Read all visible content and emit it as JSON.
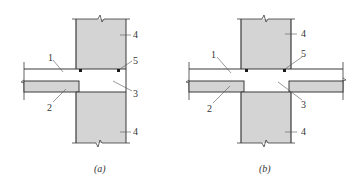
{
  "figure": {
    "colors": {
      "concrete_fill": "#d4d4d4",
      "line": "#3a3a3a",
      "label": "#333333",
      "background": "#ffffff"
    },
    "panels": [
      {
        "id": "a",
        "caption": "(a)",
        "labels": {
          "l1": "1",
          "l2": "2",
          "l3": "3",
          "l4_top": "4",
          "l4_bottom": "4",
          "l5": "5"
        }
      },
      {
        "id": "b",
        "caption": "(b)",
        "labels": {
          "l1": "1",
          "l2": "2",
          "l3": "3",
          "l4_top": "4",
          "l4_bottom": "4",
          "l5": "5"
        }
      }
    ]
  }
}
